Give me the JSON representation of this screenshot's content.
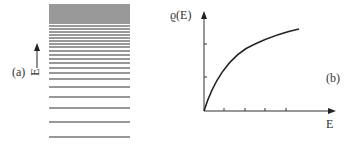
{
  "panel_a": {
    "label": "(a)",
    "axis_label": "E",
    "level_lines_y": [
      5,
      7,
      9,
      11,
      13,
      15,
      17,
      19,
      21,
      23,
      26,
      29,
      32,
      35,
      38,
      41,
      44,
      47,
      51,
      55,
      59,
      63,
      68,
      73,
      79,
      87,
      97,
      108,
      122,
      137
    ],
    "line_x1": 49,
    "line_x2": 130
  },
  "panel_b": {
    "label": "(b)",
    "y_axis_label": "ϱ(E)",
    "x_axis_label": "E",
    "curve": "saturating, concave",
    "x_ticks": 4,
    "y_ticks": 2
  },
  "colors": {
    "ink": "#222222"
  }
}
